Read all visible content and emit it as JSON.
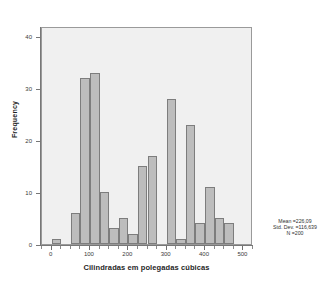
{
  "chart_data": {
    "type": "bar",
    "subtype": "histogram",
    "title": "",
    "xlabel": "Cilindradas em polegadas cúbicas",
    "ylabel": "Frequency",
    "xlim": [
      -25,
      525
    ],
    "ylim": [
      0,
      42
    ],
    "grid": false,
    "legend": null,
    "bin_width": 25,
    "bar_color": "#bdbdbd",
    "bar_edge_color": "#7d7d7d",
    "plot_background": "#f0f0f0",
    "x_ticks": [
      0,
      100,
      200,
      300,
      400,
      500
    ],
    "x_tick_labels": [
      "0",
      "100",
      "200",
      "300",
      "400",
      "500"
    ],
    "y_ticks": [
      0,
      10,
      20,
      30,
      40
    ],
    "y_tick_labels": [
      "0",
      "10",
      "20",
      "30",
      "40"
    ],
    "bins": [
      {
        "bin_start": 0,
        "bin_end": 25,
        "bin_center": 12,
        "value": 1
      },
      {
        "bin_start": 50,
        "bin_end": 75,
        "bin_center": 62,
        "value": 6
      },
      {
        "bin_start": 75,
        "bin_end": 100,
        "bin_center": 87,
        "value": 32
      },
      {
        "bin_start": 100,
        "bin_end": 125,
        "bin_center": 112,
        "value": 33
      },
      {
        "bin_start": 125,
        "bin_end": 150,
        "bin_center": 137,
        "value": 10
      },
      {
        "bin_start": 150,
        "bin_end": 175,
        "bin_center": 162,
        "value": 3
      },
      {
        "bin_start": 175,
        "bin_end": 200,
        "bin_center": 187,
        "value": 5
      },
      {
        "bin_start": 200,
        "bin_end": 225,
        "bin_center": 212,
        "value": 2
      },
      {
        "bin_start": 225,
        "bin_end": 250,
        "bin_center": 237,
        "value": 15
      },
      {
        "bin_start": 250,
        "bin_end": 275,
        "bin_center": 262,
        "value": 17
      },
      {
        "bin_start": 300,
        "bin_end": 325,
        "bin_center": 312,
        "value": 28
      },
      {
        "bin_start": 325,
        "bin_end": 350,
        "bin_center": 337,
        "value": 1
      },
      {
        "bin_start": 350,
        "bin_end": 375,
        "bin_center": 362,
        "value": 23
      },
      {
        "bin_start": 375,
        "bin_end": 400,
        "bin_center": 387,
        "value": 4
      },
      {
        "bin_start": 400,
        "bin_end": 425,
        "bin_center": 412,
        "value": 11
      },
      {
        "bin_start": 425,
        "bin_end": 450,
        "bin_center": 437,
        "value": 5
      },
      {
        "bin_start": 450,
        "bin_end": 475,
        "bin_center": 462,
        "value": 4
      }
    ],
    "annotations": {
      "mean": "Mean =226,09",
      "std_dev": "Std. Dev. =116,639",
      "n": "N =200"
    }
  }
}
